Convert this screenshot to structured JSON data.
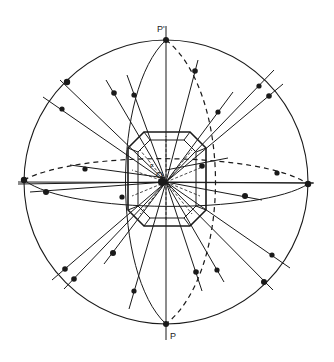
{
  "diagram": {
    "type": "stereographic-projection",
    "labels": {
      "top_pole": "P'",
      "bottom_pole": "P",
      "center": "O",
      "center_small": "F"
    },
    "colors": {
      "line": "#1a1a1a",
      "background": "#ffffff"
    },
    "primitive_circle": {
      "cx": 166,
      "cy": 182,
      "r": 142
    },
    "octagon": [
      [
        128,
        148
      ],
      [
        144,
        132
      ],
      [
        190,
        132
      ],
      [
        206,
        148
      ],
      [
        206,
        210
      ],
      [
        190,
        226
      ],
      [
        144,
        226
      ],
      [
        128,
        210
      ]
    ],
    "inner_octagon": [
      [
        138,
        152
      ],
      [
        150,
        140
      ],
      [
        184,
        140
      ],
      [
        196,
        152
      ],
      [
        196,
        206
      ],
      [
        184,
        218
      ],
      [
        150,
        218
      ],
      [
        138,
        206
      ]
    ],
    "rays": [
      {
        "x1": 166,
        "y1": 182,
        "x2": 60,
        "y2": 80
      },
      {
        "x1": 166,
        "y1": 182,
        "x2": 43,
        "y2": 97
      },
      {
        "x1": 166,
        "y1": 182,
        "x2": 106,
        "y2": 80
      },
      {
        "x1": 166,
        "y1": 182,
        "x2": 127,
        "y2": 75
      },
      {
        "x1": 166,
        "y1": 182,
        "x2": 198,
        "y2": 60
      },
      {
        "x1": 166,
        "y1": 182,
        "x2": 233,
        "y2": 92
      },
      {
        "x1": 166,
        "y1": 182,
        "x2": 274,
        "y2": 70
      },
      {
        "x1": 166,
        "y1": 182,
        "x2": 283,
        "y2": 84
      },
      {
        "x1": 166,
        "y1": 182,
        "x2": 18,
        "y2": 184
      },
      {
        "x1": 166,
        "y1": 182,
        "x2": 30,
        "y2": 192
      },
      {
        "x1": 166,
        "y1": 182,
        "x2": 313,
        "y2": 183
      },
      {
        "x1": 166,
        "y1": 182,
        "x2": 262,
        "y2": 200
      },
      {
        "x1": 166,
        "y1": 182,
        "x2": 52,
        "y2": 280
      },
      {
        "x1": 166,
        "y1": 182,
        "x2": 64,
        "y2": 289
      },
      {
        "x1": 166,
        "y1": 182,
        "x2": 104,
        "y2": 264
      },
      {
        "x1": 166,
        "y1": 182,
        "x2": 129,
        "y2": 309
      },
      {
        "x1": 166,
        "y1": 182,
        "x2": 202,
        "y2": 291
      },
      {
        "x1": 166,
        "y1": 182,
        "x2": 224,
        "y2": 282
      },
      {
        "x1": 166,
        "y1": 182,
        "x2": 290,
        "y2": 268
      },
      {
        "x1": 166,
        "y1": 182,
        "x2": 273,
        "y2": 290
      },
      {
        "x1": 70,
        "y1": 165,
        "x2": 166,
        "y2": 178
      },
      {
        "x1": 166,
        "y1": 170,
        "x2": 228,
        "y2": 158
      }
    ],
    "dots": [
      {
        "x": 67,
        "y": 82,
        "r": 3.2
      },
      {
        "x": 62,
        "y": 109,
        "r": 2.6
      },
      {
        "x": 114,
        "y": 93,
        "r": 2.8
      },
      {
        "x": 134,
        "y": 95,
        "r": 2.6
      },
      {
        "x": 195,
        "y": 71,
        "r": 2.8
      },
      {
        "x": 218,
        "y": 112,
        "r": 2.6
      },
      {
        "x": 259,
        "y": 86,
        "r": 2.6
      },
      {
        "x": 269,
        "y": 96,
        "r": 2.8
      },
      {
        "x": 24,
        "y": 180,
        "r": 3.2
      },
      {
        "x": 85,
        "y": 169,
        "r": 2.6
      },
      {
        "x": 46,
        "y": 192,
        "r": 3.0
      },
      {
        "x": 202,
        "y": 166,
        "r": 2.8
      },
      {
        "x": 277,
        "y": 173,
        "r": 2.6
      },
      {
        "x": 308,
        "y": 184,
        "r": 3.2
      },
      {
        "x": 245,
        "y": 196,
        "r": 3.0
      },
      {
        "x": 122,
        "y": 197,
        "r": 2.6
      },
      {
        "x": 65,
        "y": 269,
        "r": 2.8
      },
      {
        "x": 74,
        "y": 279,
        "r": 2.8
      },
      {
        "x": 113,
        "y": 253,
        "r": 3.0
      },
      {
        "x": 134,
        "y": 291,
        "r": 2.6
      },
      {
        "x": 196,
        "y": 272,
        "r": 2.8
      },
      {
        "x": 217,
        "y": 270,
        "r": 2.6
      },
      {
        "x": 272,
        "y": 255,
        "r": 2.6
      },
      {
        "x": 264,
        "y": 282,
        "r": 3.0
      },
      {
        "x": 166,
        "y": 40,
        "r": 3.0
      },
      {
        "x": 166,
        "y": 324,
        "r": 3.0
      },
      {
        "x": 162,
        "y": 182,
        "r": 4.0
      }
    ]
  }
}
